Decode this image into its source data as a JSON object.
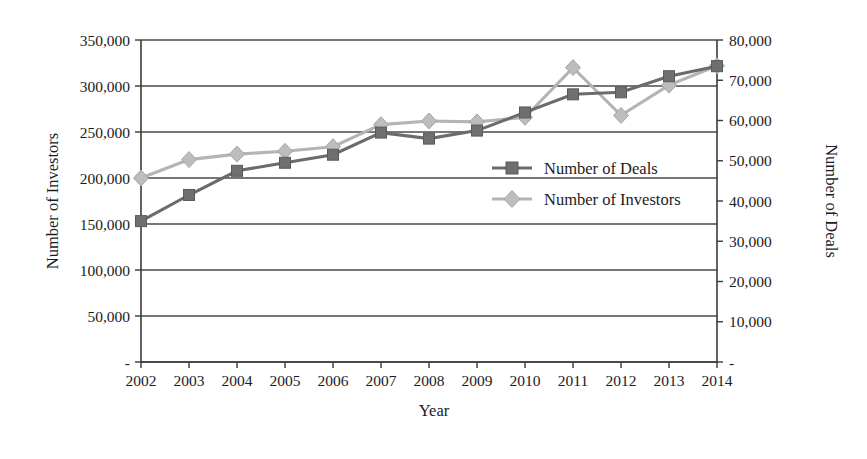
{
  "chart_data": {
    "type": "line",
    "title": "",
    "xlabel": "Year",
    "ylabel": "Number of Investors",
    "y2label": "Number of Deals",
    "grid": true,
    "legend_position": "center-right-inside",
    "categories": [
      "2002",
      "2003",
      "2004",
      "2005",
      "2006",
      "2007",
      "2008",
      "2009",
      "2010",
      "2011",
      "2012",
      "2013",
      "2014"
    ],
    "ylim": [
      0,
      350000
    ],
    "y2lim": [
      0,
      80000
    ],
    "yticks": [
      "-",
      "50,000",
      "100,000",
      "150,000",
      "200,000",
      "250,000",
      "300,000",
      "350,000"
    ],
    "ytick_values": [
      0,
      50000,
      100000,
      150000,
      200000,
      250000,
      300000,
      350000
    ],
    "y2ticks": [
      "-",
      "10,000",
      "20,000",
      "30,000",
      "40,000",
      "50,000",
      "60,000",
      "70,000",
      "80,000"
    ],
    "y2tick_values": [
      0,
      10000,
      20000,
      30000,
      40000,
      50000,
      60000,
      70000,
      80000
    ],
    "series": [
      {
        "name": "Number of Deals",
        "axis": "right",
        "marker": "square",
        "color": "#6f6f6f",
        "values": [
          35000,
          41500,
          47500,
          49500,
          51500,
          57000,
          55500,
          57500,
          62000,
          66500,
          67000,
          71000,
          73500
        ]
      },
      {
        "name": "Number of Investors",
        "axis": "left",
        "marker": "diamond",
        "color": "#bdbdbd",
        "values": [
          200000,
          220000,
          226000,
          229000,
          234000,
          258000,
          262000,
          261000,
          266000,
          320000,
          268000,
          301000,
          322000
        ]
      }
    ]
  },
  "legend": {
    "items": [
      {
        "label": "Number of Deals"
      },
      {
        "label": "Number of Investors"
      }
    ]
  },
  "axes": {
    "x_title": "Year",
    "y_left_title": "Number of Investors",
    "y_right_title": "Number of Deals"
  }
}
